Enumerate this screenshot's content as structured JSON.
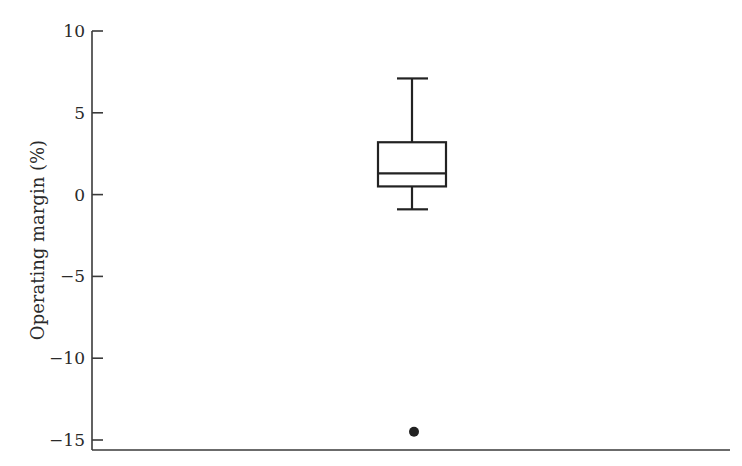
{
  "chart_data": {
    "type": "box",
    "title": "",
    "xlabel": "",
    "ylabel": "Operating margin (%)",
    "ylim": [
      -15,
      10
    ],
    "yticks": [
      10,
      5,
      0,
      -5,
      -10,
      -15
    ],
    "ytick_labels": [
      "10",
      "5",
      "0",
      "−5",
      "−10",
      "−15"
    ],
    "grid": false,
    "legend": null,
    "series": [
      {
        "name": "Operating margin",
        "whisker_low": -0.9,
        "q1": 0.5,
        "median": 1.3,
        "q3": 3.2,
        "whisker_high": 7.1,
        "outliers": [
          -14.5
        ]
      }
    ]
  },
  "colors": {
    "ink": "#222222",
    "axis": "#3a3a3a",
    "background": "#ffffff"
  }
}
